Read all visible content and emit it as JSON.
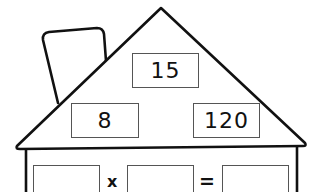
{
  "worksheet": {
    "type": "fact-family-house",
    "roof": {
      "top_number": "15",
      "left_number": "8",
      "right_number": "120"
    },
    "equation": {
      "operand1": "",
      "operator": "x",
      "operand2": "",
      "equals": "=",
      "result": ""
    }
  },
  "colors": {
    "line": "#111111",
    "box_border": "#555555",
    "background": "#ffffff"
  }
}
